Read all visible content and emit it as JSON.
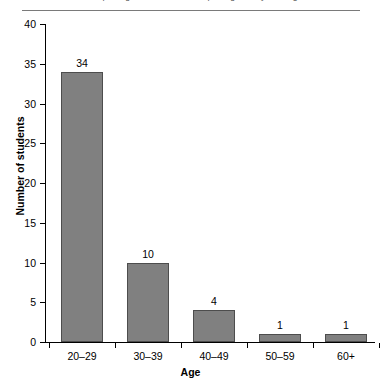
{
  "header": {
    "running_title": "Interpreting the Evidence: Interpreting Survey Findings",
    "rule": "horizontal-rule"
  },
  "chart_data": {
    "type": "bar",
    "title": "",
    "categories": [
      "20–29",
      "30–39",
      "40–49",
      "50–59",
      "60+"
    ],
    "values": [
      34,
      10,
      4,
      1,
      1
    ],
    "value_labels": [
      "34",
      "10",
      "4",
      "1",
      "1"
    ],
    "xlabel": "Age",
    "ylabel": "Number of students",
    "ylim": [
      0,
      40
    ],
    "yticks": [
      0,
      5,
      10,
      15,
      20,
      25,
      30,
      35,
      40
    ],
    "ytick_labels": [
      "0",
      "5",
      "10",
      "15",
      "20",
      "25",
      "30",
      "35",
      "40"
    ],
    "grid": false,
    "legend": false,
    "bar_color": "#808080",
    "bar_edge_color": "#4d4d4d",
    "axis_color": "#000000",
    "background": "#ffffff"
  }
}
